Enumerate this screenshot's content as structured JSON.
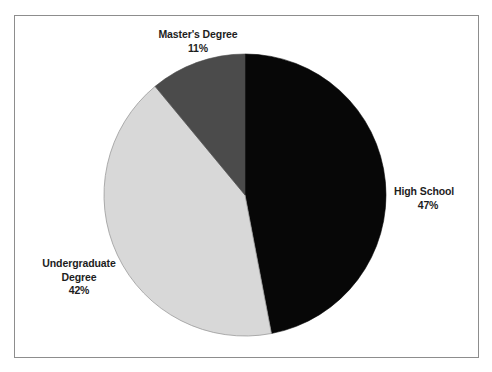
{
  "chart_data": {
    "type": "pie",
    "title": "",
    "subtitle": "",
    "xlabel": "",
    "ylabel": "",
    "legend_position": "none",
    "grid": false,
    "start_angle_deg": 0,
    "direction": "clockwise",
    "categories": [
      "High School",
      "Undergraduate Degree",
      "Master's Degree"
    ],
    "values": [
      47,
      42,
      11
    ],
    "value_unit": "%",
    "slices": [
      {
        "label": "High School",
        "label_line1": "High School",
        "label_line2": "47%",
        "value": 47,
        "value_text": "47%",
        "color": "#070707",
        "start_deg": 0,
        "end_deg": 169.2
      },
      {
        "label": "Undergraduate Degree",
        "label_line1": "Undergraduate",
        "label_line2": "Degree",
        "label_line3": "42%",
        "value": 42,
        "value_text": "42%",
        "color": "#d8d8d8",
        "start_deg": 169.2,
        "end_deg": 320.4
      },
      {
        "label": "Master's Degree",
        "label_line1": "Master's Degree",
        "label_line2": "11%",
        "value": 11,
        "value_text": "11%",
        "color": "#4b4b4b",
        "start_deg": 320.4,
        "end_deg": 360
      }
    ]
  },
  "figure": {
    "border_color": "#8d8d8d",
    "background": "#ffffff",
    "outline_color": "#9a9a9a"
  }
}
